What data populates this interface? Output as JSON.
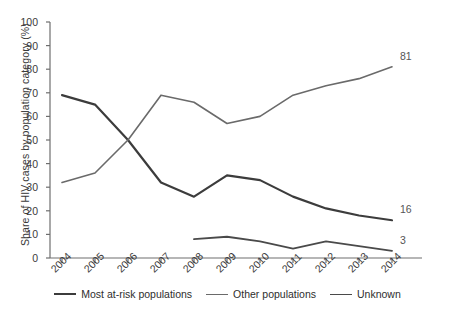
{
  "chart_data": {
    "type": "line",
    "title": "",
    "xlabel": "",
    "ylabel": "Share of HIV cases by population category (%)",
    "categories": [
      "2004",
      "2005",
      "2006",
      "2007",
      "2008",
      "2009",
      "2010",
      "2011",
      "2012",
      "2013",
      "2014"
    ],
    "x": [
      2004,
      2005,
      2006,
      2007,
      2008,
      2009,
      2010,
      2011,
      2012,
      2013,
      2014
    ],
    "ylim": [
      0,
      100
    ],
    "yticks": [
      "0",
      "10",
      "20",
      "30",
      "40",
      "50",
      "60",
      "70",
      "80",
      "90",
      "100"
    ],
    "ytick_values": [
      0,
      10,
      20,
      30,
      40,
      50,
      60,
      70,
      80,
      90,
      100
    ],
    "grid": false,
    "legend_position": "bottom",
    "series": [
      {
        "name": "Most at-risk populations",
        "color": "#3c3c3c",
        "width": 2.2,
        "values": [
          69,
          65,
          50,
          32,
          26,
          35,
          33,
          26,
          21,
          18,
          16
        ],
        "end_label": "16"
      },
      {
        "name": "Other populations",
        "color": "#6a6a6a",
        "width": 1.6,
        "values": [
          32,
          36,
          50,
          69,
          66,
          57,
          60,
          69,
          73,
          76,
          81
        ],
        "end_label": "81"
      },
      {
        "name": "Unknown",
        "color": "#4a4a4a",
        "width": 1.8,
        "values": [
          null,
          null,
          null,
          null,
          8,
          9,
          7,
          4,
          7,
          5,
          3
        ],
        "end_label": "3"
      }
    ],
    "annotations": [
      {
        "text": "81",
        "series": "Other populations",
        "x": 2014,
        "y": 81
      },
      {
        "text": "16",
        "series": "Most at-risk populations",
        "x": 2014,
        "y": 16
      },
      {
        "text": "3",
        "series": "Unknown",
        "x": 2014,
        "y": 3
      }
    ]
  },
  "axes": {
    "axis_color": "#6e6e6e"
  }
}
